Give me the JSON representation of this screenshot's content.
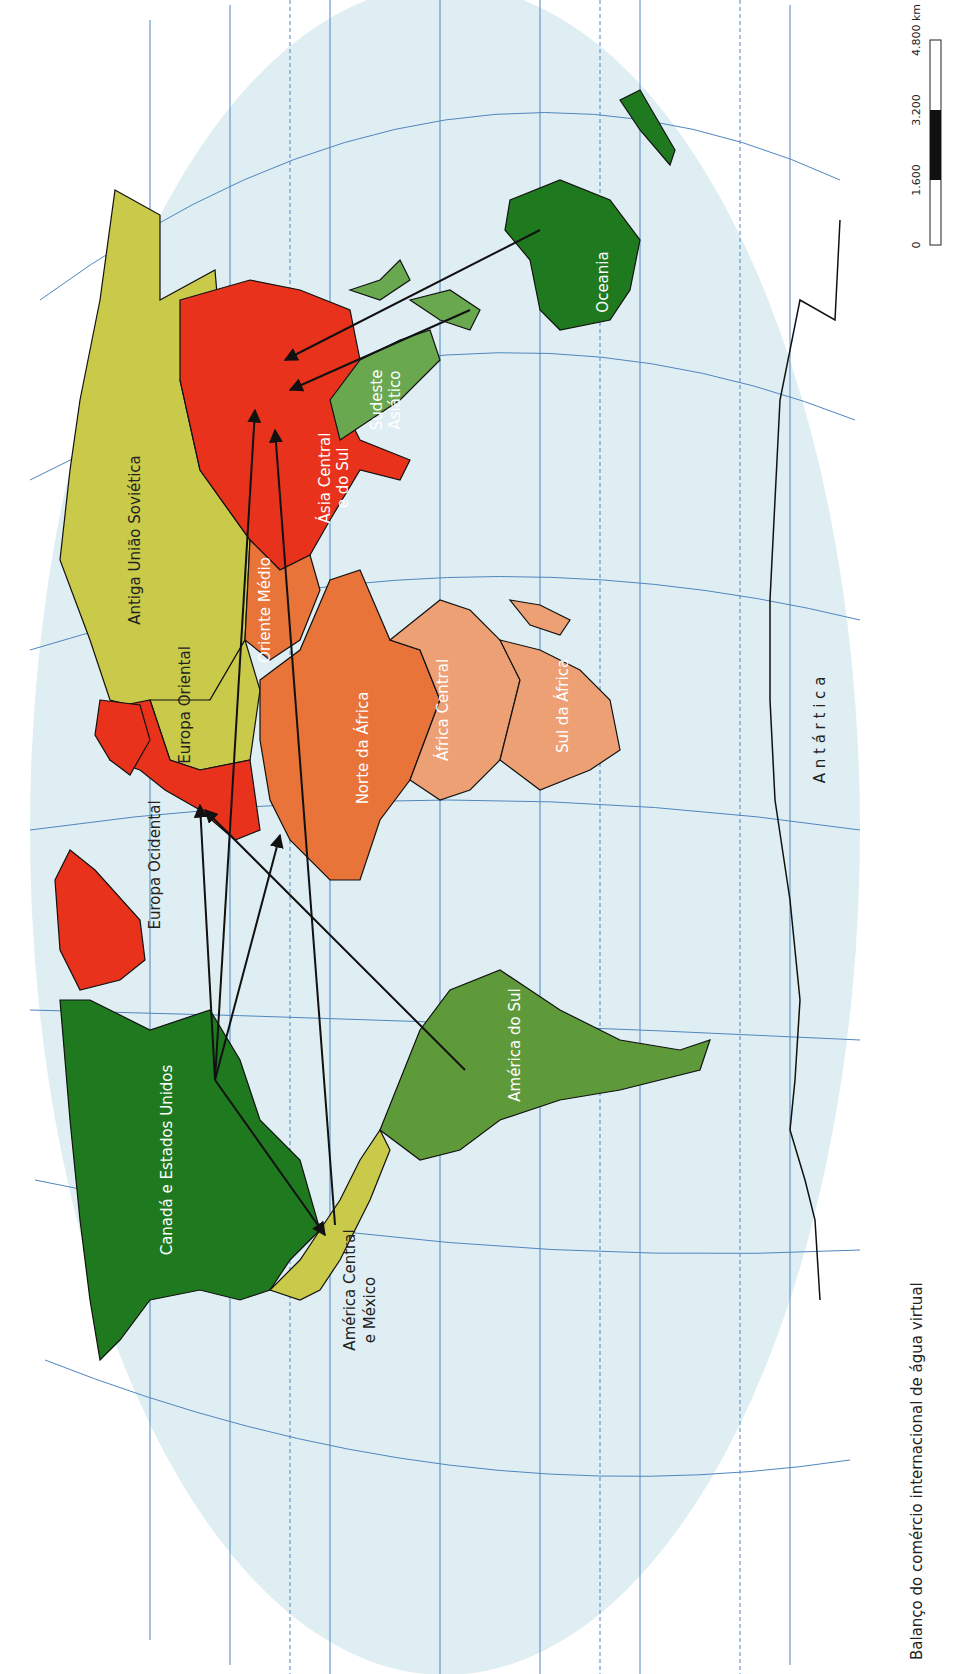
{
  "title": "Balanço do comércio internacional de água virtual",
  "scale_bar": {
    "unit": "km",
    "ticks": [
      "0",
      "1.600",
      "3.200",
      "4.800 km"
    ]
  },
  "colors": {
    "ocean": "#dfeef2",
    "graticule": "#4f86c0",
    "strong_importer": "#e8321c",
    "importer_orange": "#e8743a",
    "importer_light_orange": "#eea075",
    "neutral_yellow": "#c9c94a",
    "exporter_light_green": "#6aa84f",
    "exporter_mid_green": "#5f9a3a",
    "exporter_dark_green": "#1f7a1f"
  },
  "regions": [
    {
      "name": "Antiga União Soviética",
      "category": "neutral_yellow"
    },
    {
      "name": "Europa Oriental",
      "category": "neutral_yellow"
    },
    {
      "name": "Europa Ocidental",
      "category": "strong_importer"
    },
    {
      "name": "Oriente Médio",
      "category": "importer_orange"
    },
    {
      "name": "Ásia Central e do Sul",
      "category": "strong_importer"
    },
    {
      "name": "Sudeste Asiático",
      "category": "exporter_light_green"
    },
    {
      "name": "Oceania",
      "category": "exporter_dark_green"
    },
    {
      "name": "Norte da África",
      "category": "importer_orange"
    },
    {
      "name": "África Central",
      "category": "importer_light_orange"
    },
    {
      "name": "Sul da África",
      "category": "importer_light_orange"
    },
    {
      "name": "Canadá e Estados Unidos",
      "category": "exporter_dark_green"
    },
    {
      "name": "América Central e México",
      "category": "neutral_yellow"
    },
    {
      "name": "América do Sul",
      "category": "exporter_mid_green"
    },
    {
      "name": "Antártica",
      "category": "none"
    }
  ],
  "labels": {
    "ussr": "Antiga União Soviética",
    "east_europe": "Europa Oriental",
    "west_europe": "Europa Ocidental",
    "middle_east": "Oriente Médio",
    "central_asia_1": "Ásia Central",
    "central_asia_2": "e do Sul",
    "se_asia_1": "Sudeste",
    "se_asia_2": "Asiático",
    "oceania": "Oceania",
    "north_africa": "Norte da África",
    "central_africa": "África Central",
    "south_africa": "Sul da África",
    "canada_usa": "Canadá e Estados Unidos",
    "central_america_1": "América Central",
    "central_america_2": "e México",
    "south_america": "América do Sul",
    "antarctica": "A n t á r t i c a"
  },
  "flows": [
    {
      "from": "Oceania",
      "to": "Ásia Central e do Sul"
    },
    {
      "from": "Sudeste Asiático",
      "to": "Ásia Central e do Sul"
    },
    {
      "from": "Canadá e Estados Unidos",
      "to": "Ásia Central e do Sul"
    },
    {
      "from": "América Central e México",
      "to": "Ásia Central e do Sul"
    },
    {
      "from": "Canadá e Estados Unidos",
      "to": "Europa Ocidental"
    },
    {
      "from": "América do Sul",
      "to": "Europa Ocidental"
    },
    {
      "from": "Canadá e Estados Unidos",
      "to": "Norte da África"
    },
    {
      "from": "Canadá e Estados Unidos",
      "to": "América Central e México"
    }
  ]
}
